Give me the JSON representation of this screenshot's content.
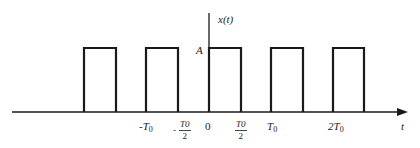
{
  "diagram": {
    "y_axis_label": "x(t)",
    "x_axis_label": "t",
    "amplitude_label": "A",
    "tick_labels": [
      {
        "id": "neg_T0",
        "prefix": "-",
        "main": "T",
        "sub": "0"
      },
      {
        "id": "neg_T0_half",
        "prefix": "-",
        "num": "T0",
        "den": "2"
      },
      {
        "id": "zero",
        "main": "0"
      },
      {
        "id": "T0_half",
        "num": "T0",
        "den": "2"
      },
      {
        "id": "T0",
        "main": "T",
        "sub": "0"
      },
      {
        "id": "two_T0",
        "main": "2T",
        "sub": "0"
      }
    ],
    "pulses": [
      {
        "start_px": 84,
        "end_px": 116
      },
      {
        "start_px": 146,
        "end_px": 178
      },
      {
        "start_px": 209,
        "end_px": 241
      },
      {
        "start_px": 271,
        "end_px": 303
      },
      {
        "start_px": 333,
        "end_px": 364
      }
    ],
    "line_color": "#1a1a1a"
  }
}
